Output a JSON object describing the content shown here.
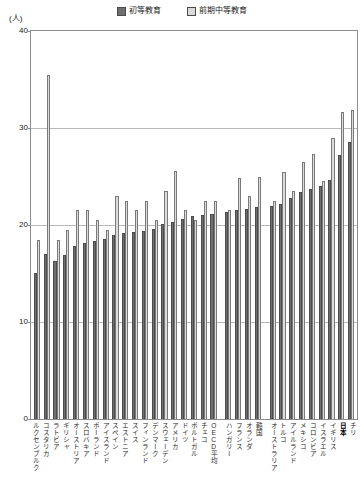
{
  "unit_label": "(人)",
  "legend": {
    "items": [
      {
        "label": "初等教育",
        "color": "#6f6f6f",
        "icon": "filled-square-icon"
      },
      {
        "label": "前期中等教育",
        "color": "#dcdcdc",
        "icon": "light-square-icon"
      }
    ]
  },
  "axis": {
    "y_ticks": [
      "0",
      "10",
      "20",
      "30",
      "40"
    ]
  },
  "chart_data": {
    "type": "bar",
    "title": "",
    "subtitle": "",
    "xlabel": "",
    "ylabel": "(人)",
    "ylim": [
      0,
      40
    ],
    "ytick_values": [
      0,
      10,
      20,
      30,
      40
    ],
    "grid": true,
    "legend_position": "top-center",
    "highlight_category": "日本",
    "gap_after_categories": [
      "OECD平均",
      "韓国"
    ],
    "categories": [
      "ルクセンブルク",
      "コスタリカ",
      "ラトビア",
      "ギリシャ",
      "オーストリア",
      "スロバキア",
      "ポーランド",
      "アイスランド",
      "スペイン",
      "エストニア",
      "スイス",
      "フィンランド",
      "デンマーク",
      "スウェーデン",
      "アメリカ",
      "ドイツ",
      "ポルトガル",
      "チェコ",
      "OECD平均",
      "ハンガリー",
      "フランス",
      "オランダ",
      "韓国",
      "オーストラリア",
      "トルコ",
      "アイルランド",
      "メキシコ",
      "コロンビア",
      "イスラエル",
      "イギリス",
      "日本",
      "チリ"
    ],
    "series": [
      {
        "name": "初等教育",
        "color": "#6f6f6f",
        "values": [
          15.1,
          17.0,
          16.3,
          16.9,
          17.8,
          18.1,
          18.4,
          18.6,
          19.0,
          19.2,
          19.3,
          19.4,
          19.6,
          20.1,
          20.3,
          20.6,
          20.9,
          21.0,
          21.1,
          21.3,
          21.5,
          21.7,
          21.9,
          22.0,
          22.2,
          22.8,
          23.4,
          23.7,
          24.0,
          24.6,
          27.2,
          28.6
        ]
      },
      {
        "name": "前期中等教育",
        "color": "#dcdcdc",
        "values": [
          18.5,
          35.5,
          18.5,
          19.5,
          21.5,
          21.5,
          20.5,
          19.5,
          23.0,
          22.5,
          21.5,
          22.5,
          20.5,
          23.5,
          25.6,
          21.5,
          20.5,
          22.5,
          22.5,
          21.5,
          24.8,
          23.0,
          25.0,
          22.5,
          25.5,
          23.5,
          26.5,
          27.3,
          24.5,
          29.0,
          31.6,
          31.9
        ]
      }
    ]
  }
}
